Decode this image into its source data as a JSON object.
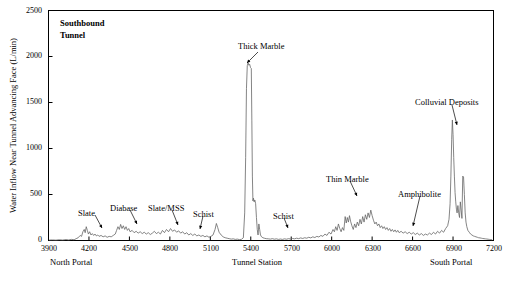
{
  "chart_data": {
    "type": "line",
    "xlabel": "Tunnel Station",
    "ylabel": "Water Inflow Near Tunnel Advancing Face (L/min)",
    "xlim": [
      3900,
      7200
    ],
    "ylim": [
      0,
      2500
    ],
    "xticks": [
      3900,
      4200,
      4500,
      4800,
      5100,
      5400,
      5700,
      6000,
      6300,
      6600,
      6900,
      7200
    ],
    "yticks": [
      0,
      500,
      1000,
      1500,
      2000,
      2500
    ],
    "grid": false,
    "legend": "none",
    "axis_end_labels": {
      "left": "North Portal",
      "right": "South Portal"
    },
    "annotations": [
      {
        "label": "Slate",
        "x": 4180,
        "y": 330
      },
      {
        "label": "Diabase",
        "x": 4470,
        "y": 370
      },
      {
        "label": "Slate/MSS",
        "x": 4790,
        "y": 370
      },
      {
        "label": "Schist",
        "x": 5120,
        "y": 320
      },
      {
        "label": "Thick Marble",
        "x": 5450,
        "y": 2230
      },
      {
        "label": "Schist",
        "x": 5780,
        "y": 300
      },
      {
        "label": "Thin Marble",
        "x": 6290,
        "y": 520
      },
      {
        "label": "Amphibolite",
        "x": 6640,
        "y": 390
      },
      {
        "label": "Colluvial Deposits",
        "x": 6940,
        "y": 1580
      }
    ],
    "series": [
      {
        "name": "Water inflow",
        "points": [
          [
            3905,
            5
          ],
          [
            3930,
            6
          ],
          [
            3955,
            4
          ],
          [
            3980,
            8
          ],
          [
            4005,
            5
          ],
          [
            4030,
            10
          ],
          [
            4050,
            6
          ],
          [
            4070,
            12
          ],
          [
            4090,
            8
          ],
          [
            4105,
            20
          ],
          [
            4120,
            30
          ],
          [
            4135,
            55
          ],
          [
            4145,
            45
          ],
          [
            4155,
            95
          ],
          [
            4165,
            120
          ],
          [
            4172,
            85
          ],
          [
            4180,
            150
          ],
          [
            4188,
            110
          ],
          [
            4196,
            70
          ],
          [
            4205,
            95
          ],
          [
            4215,
            60
          ],
          [
            4225,
            75
          ],
          [
            4235,
            55
          ],
          [
            4245,
            70
          ],
          [
            4255,
            50
          ],
          [
            4265,
            60
          ],
          [
            4275,
            45
          ],
          [
            4290,
            55
          ],
          [
            4305,
            40
          ],
          [
            4320,
            50
          ],
          [
            4335,
            35
          ],
          [
            4350,
            45
          ],
          [
            4365,
            40
          ],
          [
            4380,
            55
          ],
          [
            4395,
            70
          ],
          [
            4405,
            110
          ],
          [
            4415,
            150
          ],
          [
            4425,
            120
          ],
          [
            4435,
            175
          ],
          [
            4445,
            130
          ],
          [
            4455,
            160
          ],
          [
            4465,
            120
          ],
          [
            4475,
            150
          ],
          [
            4485,
            110
          ],
          [
            4495,
            130
          ],
          [
            4505,
            95
          ],
          [
            4520,
            110
          ],
          [
            4535,
            85
          ],
          [
            4550,
            100
          ],
          [
            4565,
            80
          ],
          [
            4580,
            95
          ],
          [
            4595,
            75
          ],
          [
            4610,
            90
          ],
          [
            4625,
            70
          ],
          [
            4640,
            85
          ],
          [
            4655,
            65
          ],
          [
            4670,
            80
          ],
          [
            4685,
            100
          ],
          [
            4700,
            75
          ],
          [
            4715,
            90
          ],
          [
            4730,
            70
          ],
          [
            4745,
            110
          ],
          [
            4760,
            85
          ],
          [
            4775,
            120
          ],
          [
            4790,
            95
          ],
          [
            4805,
            130
          ],
          [
            4820,
            100
          ],
          [
            4835,
            115
          ],
          [
            4850,
            90
          ],
          [
            4865,
            105
          ],
          [
            4880,
            80
          ],
          [
            4895,
            95
          ],
          [
            4910,
            70
          ],
          [
            4925,
            85
          ],
          [
            4940,
            60
          ],
          [
            4955,
            75
          ],
          [
            4970,
            55
          ],
          [
            4985,
            70
          ],
          [
            5000,
            50
          ],
          [
            5015,
            60
          ],
          [
            5030,
            45
          ],
          [
            5045,
            55
          ],
          [
            5060,
            40
          ],
          [
            5075,
            50
          ],
          [
            5090,
            35
          ],
          [
            5105,
            45
          ],
          [
            5120,
            60
          ],
          [
            5135,
            120
          ],
          [
            5145,
            185
          ],
          [
            5155,
            140
          ],
          [
            5165,
            90
          ],
          [
            5180,
            60
          ],
          [
            5195,
            40
          ],
          [
            5210,
            30
          ],
          [
            5225,
            25
          ],
          [
            5240,
            20
          ],
          [
            5255,
            15
          ],
          [
            5270,
            18
          ],
          [
            5285,
            12
          ],
          [
            5300,
            15
          ],
          [
            5315,
            10
          ],
          [
            5330,
            12
          ],
          [
            5345,
            30
          ],
          [
            5355,
            300
          ],
          [
            5362,
            900
          ],
          [
            5368,
            1650
          ],
          [
            5374,
            1900
          ],
          [
            5380,
            1930
          ],
          [
            5386,
            1905
          ],
          [
            5392,
            1915
          ],
          [
            5398,
            1880
          ],
          [
            5404,
            1870
          ],
          [
            5408,
            1300
          ],
          [
            5412,
            700
          ],
          [
            5416,
            430
          ],
          [
            5420,
            460
          ],
          [
            5425,
            420
          ],
          [
            5430,
            440
          ],
          [
            5436,
            400
          ],
          [
            5442,
            250
          ],
          [
            5448,
            120
          ],
          [
            5454,
            60
          ],
          [
            5460,
            180
          ],
          [
            5466,
            120
          ],
          [
            5472,
            60
          ],
          [
            5480,
            40
          ],
          [
            5490,
            30
          ],
          [
            5500,
            25
          ],
          [
            5515,
            20
          ],
          [
            5530,
            18
          ],
          [
            5545,
            15
          ],
          [
            5560,
            20
          ],
          [
            5575,
            14
          ],
          [
            5590,
            18
          ],
          [
            5605,
            12
          ],
          [
            5620,
            16
          ],
          [
            5635,
            12
          ],
          [
            5650,
            18
          ],
          [
            5665,
            14
          ],
          [
            5680,
            20
          ],
          [
            5695,
            16
          ],
          [
            5710,
            22
          ],
          [
            5725,
            18
          ],
          [
            5740,
            25
          ],
          [
            5755,
            20
          ],
          [
            5770,
            28
          ],
          [
            5785,
            22
          ],
          [
            5800,
            30
          ],
          [
            5815,
            25
          ],
          [
            5830,
            35
          ],
          [
            5845,
            28
          ],
          [
            5860,
            40
          ],
          [
            5875,
            32
          ],
          [
            5890,
            45
          ],
          [
            5905,
            38
          ],
          [
            5920,
            55
          ],
          [
            5935,
            45
          ],
          [
            5950,
            70
          ],
          [
            5965,
            55
          ],
          [
            5980,
            90
          ],
          [
            5995,
            70
          ],
          [
            6010,
            120
          ],
          [
            6020,
            95
          ],
          [
            6030,
            150
          ],
          [
            6040,
            110
          ],
          [
            6050,
            180
          ],
          [
            6060,
            130
          ],
          [
            6070,
            95
          ],
          [
            6080,
            140
          ],
          [
            6090,
            110
          ],
          [
            6100,
            260
          ],
          [
            6108,
            190
          ],
          [
            6116,
            250
          ],
          [
            6124,
            200
          ],
          [
            6132,
            270
          ],
          [
            6140,
            210
          ],
          [
            6150,
            160
          ],
          [
            6160,
            120
          ],
          [
            6170,
            180
          ],
          [
            6180,
            140
          ],
          [
            6190,
            200
          ],
          [
            6200,
            160
          ],
          [
            6210,
            230
          ],
          [
            6220,
            180
          ],
          [
            6230,
            260
          ],
          [
            6240,
            200
          ],
          [
            6250,
            280
          ],
          [
            6260,
            230
          ],
          [
            6270,
            300
          ],
          [
            6280,
            250
          ],
          [
            6290,
            330
          ],
          [
            6300,
            270
          ],
          [
            6310,
            220
          ],
          [
            6320,
            180
          ],
          [
            6330,
            200
          ],
          [
            6340,
            160
          ],
          [
            6350,
            180
          ],
          [
            6360,
            140
          ],
          [
            6370,
            160
          ],
          [
            6380,
            130
          ],
          [
            6390,
            150
          ],
          [
            6400,
            120
          ],
          [
            6410,
            140
          ],
          [
            6420,
            110
          ],
          [
            6430,
            130
          ],
          [
            6440,
            100
          ],
          [
            6450,
            120
          ],
          [
            6460,
            95
          ],
          [
            6470,
            115
          ],
          [
            6480,
            90
          ],
          [
            6490,
            110
          ],
          [
            6500,
            85
          ],
          [
            6515,
            100
          ],
          [
            6530,
            80
          ],
          [
            6545,
            95
          ],
          [
            6560,
            75
          ],
          [
            6575,
            90
          ],
          [
            6590,
            70
          ],
          [
            6605,
            85
          ],
          [
            6620,
            65
          ],
          [
            6635,
            80
          ],
          [
            6650,
            60
          ],
          [
            6665,
            75
          ],
          [
            6680,
            55
          ],
          [
            6695,
            70
          ],
          [
            6710,
            60
          ],
          [
            6725,
            80
          ],
          [
            6740,
            65
          ],
          [
            6755,
            90
          ],
          [
            6770,
            70
          ],
          [
            6785,
            100
          ],
          [
            6800,
            80
          ],
          [
            6815,
            110
          ],
          [
            6830,
            90
          ],
          [
            6845,
            130
          ],
          [
            6860,
            160
          ],
          [
            6870,
            230
          ],
          [
            6878,
            400
          ],
          [
            6884,
            700
          ],
          [
            6890,
            1100
          ],
          [
            6895,
            1310
          ],
          [
            6900,
            1150
          ],
          [
            6905,
            900
          ],
          [
            6910,
            700
          ],
          [
            6915,
            520
          ],
          [
            6920,
            420
          ],
          [
            6925,
            340
          ],
          [
            6930,
            300
          ],
          [
            6936,
            380
          ],
          [
            6942,
            300
          ],
          [
            6948,
            250
          ],
          [
            6954,
            420
          ],
          [
            6960,
            330
          ],
          [
            6966,
            240
          ],
          [
            6972,
            700
          ],
          [
            6978,
            690
          ],
          [
            6984,
            500
          ],
          [
            6990,
            300
          ],
          [
            6996,
            200
          ],
          [
            7002,
            150
          ],
          [
            7010,
            110
          ],
          [
            7020,
            90
          ],
          [
            7030,
            70
          ],
          [
            7040,
            60
          ],
          [
            7050,
            50
          ],
          [
            7060,
            45
          ],
          [
            7070,
            40
          ],
          [
            7080,
            35
          ],
          [
            7090,
            30
          ],
          [
            7100,
            28
          ],
          [
            7110,
            25
          ],
          [
            7120,
            22
          ],
          [
            7130,
            20
          ],
          [
            7140,
            18
          ],
          [
            7150,
            16
          ],
          [
            7160,
            14
          ],
          [
            7170,
            12
          ],
          [
            7180,
            10
          ],
          [
            7190,
            8
          ]
        ]
      }
    ]
  },
  "labels": {
    "title": "Southbound",
    "title2": "Tunnel",
    "xlabel": "Tunnel Station",
    "ylabel": "Water Inflow Near Tunnel Advancing Face (L/min)",
    "north_portal": "North Portal",
    "south_portal": "South Portal",
    "ann_slate": "Slate",
    "ann_diabase": "Diabase",
    "ann_slate_mss": "Slate/MSS",
    "ann_schist1": "Schist",
    "ann_thick_marble": "Thick Marble",
    "ann_schist2": "Schist",
    "ann_thin_marble": "Thin Marble",
    "ann_amphibolite": "Amphibolite",
    "ann_colluvial": "Colluvial Deposits",
    "y0": "0",
    "y500": "500",
    "y1000": "1000",
    "y1500": "1500",
    "y2000": "2000",
    "y2500": "2500",
    "x3900": "3900",
    "x4200": "4200",
    "x4500": "4500",
    "x4800": "4800",
    "x5100": "5100",
    "x5400": "5400",
    "x5700": "5700",
    "x6000": "6000",
    "x6300": "6300",
    "x6600": "6600",
    "x6900": "6900",
    "x7200": "7200"
  },
  "colors": {
    "line": "#666666",
    "axis": "#000000",
    "background": "#ffffff"
  }
}
